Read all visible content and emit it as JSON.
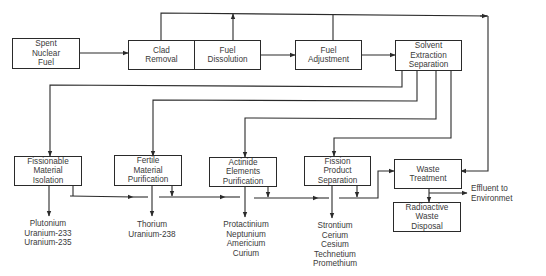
{
  "diagram": {
    "type": "process-flowchart",
    "nodes": {
      "spent_fuel": {
        "lines": [
          "Spent",
          "Nuclear",
          "Fuel"
        ]
      },
      "clad_removal": {
        "lines": [
          "Clad",
          "Removal"
        ]
      },
      "fuel_dissolution": {
        "lines": [
          "Fuel",
          "Dissolution"
        ]
      },
      "fuel_adjustment": {
        "lines": [
          "Fuel",
          "Adjustment"
        ]
      },
      "solvent_extraction": {
        "lines": [
          "Solvent",
          "Extraction",
          "Separation"
        ]
      },
      "fissionable": {
        "lines": [
          "Fissionable",
          "Material",
          "Isolation"
        ]
      },
      "fertile": {
        "lines": [
          "Fertile",
          "Material",
          "Purification"
        ]
      },
      "actinide": {
        "lines": [
          "Actinide",
          "Elements",
          "Purification"
        ]
      },
      "fission_product": {
        "lines": [
          "Fission",
          "Product",
          "Separation"
        ]
      },
      "waste_treatment": {
        "lines": [
          "Waste",
          "Treatment"
        ]
      },
      "waste_disposal": {
        "lines": [
          "Radioactive",
          "Waste",
          "Disposal"
        ]
      }
    },
    "outputs": {
      "fissionable": [
        "Plutonium",
        "Uranium-233",
        "Uranium-235"
      ],
      "fertile": [
        "Thorium",
        "Uranium-238"
      ],
      "actinide": [
        "Protactinium",
        "Neptunium",
        "Americium",
        "Curium"
      ],
      "fission_product": [
        "Strontium",
        "Cerium",
        "Cesium",
        "Technetium",
        "Promethium"
      ]
    },
    "effluent": [
      "Effluent to",
      "Environmet"
    ],
    "edges": [
      [
        "Spent Nuclear Fuel",
        "Clad Removal"
      ],
      [
        "Fuel Dissolution",
        "Fuel Adjustment"
      ],
      [
        "Fuel Adjustment",
        "Solvent Extraction Separation"
      ],
      [
        "Clad Removal",
        "Waste Treatment"
      ],
      [
        "Fuel Dissolution",
        "Waste Treatment"
      ],
      [
        "Fuel Adjustment",
        "Waste Treatment"
      ],
      [
        "Solvent Extraction Separation",
        "Fissionable Material Isolation"
      ],
      [
        "Solvent Extraction Separation",
        "Fertile Material Purification"
      ],
      [
        "Solvent Extraction Separation",
        "Actinide Elements Purification"
      ],
      [
        "Solvent Extraction Separation",
        "Fission Product Separation"
      ],
      [
        "Fissionable Material Isolation",
        "Waste Treatment"
      ],
      [
        "Fertile Material Purification",
        "Waste Treatment"
      ],
      [
        "Actinide Elements Purification",
        "Waste Treatment"
      ],
      [
        "Fission Product Separation",
        "Waste Treatment"
      ],
      [
        "Waste Treatment",
        "Radioactive Waste Disposal"
      ],
      [
        "Waste Treatment",
        "Effluent to Environmet"
      ]
    ],
    "colors": {
      "ink": "#2a2a2a",
      "background": "#ffffff"
    }
  }
}
